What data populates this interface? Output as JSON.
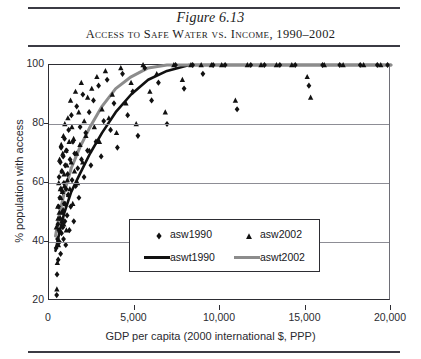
{
  "figure": {
    "number": "Figure 6.13",
    "caption": "Access to Safe Water vs. Income, 1990–2002"
  },
  "chart_data": {
    "type": "scatter",
    "title": "Access to Safe Water vs. Income, 1990–2002",
    "xlabel": "GDP per capita (2000 international $, PPP)",
    "ylabel": "% population with access",
    "xlim": [
      0,
      20000
    ],
    "ylim": [
      20,
      100
    ],
    "xticks": [
      0,
      5000,
      10000,
      15000,
      20000
    ],
    "xticklabels": [
      "0",
      "5,000",
      "10,000",
      "15,000",
      "20,000"
    ],
    "yticks": [
      20,
      40,
      60,
      80,
      100
    ],
    "yticklabels": [
      "20",
      "40",
      "60",
      "80",
      "100"
    ],
    "grid": "horizontal",
    "legend_position": "lower-center",
    "legend": [
      {
        "label": "asw1990",
        "marker": "diamond",
        "color": "#111111"
      },
      {
        "label": "asw2002",
        "marker": "triangle",
        "color": "#111111"
      },
      {
        "label": "aswt1990",
        "marker": "line",
        "color": "#111111"
      },
      {
        "label": "aswt2002",
        "marker": "line",
        "color": "#8c8c8c"
      }
    ],
    "series": [
      {
        "name": "asw1990",
        "marker": "diamond",
        "color": "#111111",
        "points": [
          [
            420,
            38
          ],
          [
            450,
            22
          ],
          [
            470,
            29
          ],
          [
            500,
            41
          ],
          [
            520,
            46
          ],
          [
            540,
            34
          ],
          [
            560,
            52
          ],
          [
            575,
            44
          ],
          [
            590,
            62
          ],
          [
            610,
            40
          ],
          [
            630,
            55
          ],
          [
            650,
            48
          ],
          [
            660,
            67
          ],
          [
            680,
            36
          ],
          [
            700,
            58
          ],
          [
            710,
            72
          ],
          [
            730,
            43
          ],
          [
            750,
            64
          ],
          [
            770,
            50
          ],
          [
            790,
            57
          ],
          [
            810,
            45
          ],
          [
            830,
            69
          ],
          [
            850,
            41
          ],
          [
            870,
            60
          ],
          [
            890,
            53
          ],
          [
            910,
            75
          ],
          [
            930,
            47
          ],
          [
            950,
            66
          ],
          [
            980,
            39
          ],
          [
            1000,
            58
          ],
          [
            1030,
            71
          ],
          [
            1060,
            49
          ],
          [
            1090,
            63
          ],
          [
            1120,
            56
          ],
          [
            1150,
            78
          ],
          [
            1190,
            44
          ],
          [
            1230,
            68
          ],
          [
            1270,
            52
          ],
          [
            1310,
            83
          ],
          [
            1350,
            61
          ],
          [
            1400,
            74
          ],
          [
            1450,
            47
          ],
          [
            1500,
            70
          ],
          [
            1560,
            59
          ],
          [
            1620,
            86
          ],
          [
            1680,
            65
          ],
          [
            1750,
            55
          ],
          [
            1820,
            79
          ],
          [
            1900,
            68
          ],
          [
            1980,
            90
          ],
          [
            2050,
            62
          ],
          [
            2150,
            77
          ],
          [
            2250,
            71
          ],
          [
            2350,
            84
          ],
          [
            2450,
            66
          ],
          [
            2600,
            88
          ],
          [
            2750,
            74
          ],
          [
            2900,
            93
          ],
          [
            3050,
            69
          ],
          [
            3200,
            81
          ],
          [
            3400,
            95
          ],
          [
            3600,
            78
          ],
          [
            3800,
            87
          ],
          [
            4000,
            72
          ],
          [
            4300,
            97
          ],
          [
            4600,
            83
          ],
          [
            4900,
            91
          ],
          [
            5200,
            76
          ],
          [
            5600,
            99
          ],
          [
            6000,
            88
          ],
          [
            6400,
            94
          ],
          [
            6900,
            80
          ],
          [
            7400,
            100
          ],
          [
            7900,
            92
          ],
          [
            8400,
            100
          ],
          [
            9000,
            97
          ],
          [
            9600,
            100
          ],
          [
            10300,
            100
          ],
          [
            11000,
            85
          ],
          [
            11800,
            100
          ],
          [
            12600,
            100
          ],
          [
            13500,
            100
          ],
          [
            14400,
            100
          ],
          [
            15200,
            93
          ],
          [
            16000,
            100
          ],
          [
            17000,
            100
          ],
          [
            18200,
            100
          ],
          [
            19200,
            100
          ],
          [
            19800,
            100
          ]
        ]
      },
      {
        "name": "asw2002",
        "marker": "triangle",
        "color": "#111111",
        "points": [
          [
            430,
            45
          ],
          [
            460,
            24
          ],
          [
            490,
            33
          ],
          [
            510,
            52
          ],
          [
            530,
            48
          ],
          [
            550,
            39
          ],
          [
            570,
            60
          ],
          [
            600,
            50
          ],
          [
            620,
            68
          ],
          [
            640,
            44
          ],
          [
            665,
            58
          ],
          [
            690,
            55
          ],
          [
            715,
            73
          ],
          [
            740,
            47
          ],
          [
            760,
            64
          ],
          [
            785,
            57
          ],
          [
            805,
            70
          ],
          [
            825,
            51
          ],
          [
            845,
            76
          ],
          [
            865,
            46
          ],
          [
            885,
            63
          ],
          [
            905,
            59
          ],
          [
            925,
            80
          ],
          [
            955,
            53
          ],
          [
            985,
            71
          ],
          [
            1015,
            44
          ],
          [
            1045,
            66
          ],
          [
            1075,
            61
          ],
          [
            1105,
            82
          ],
          [
            1140,
            56
          ],
          [
            1180,
            74
          ],
          [
            1220,
            58
          ],
          [
            1260,
            88
          ],
          [
            1300,
            67
          ],
          [
            1340,
            79
          ],
          [
            1390,
            53
          ],
          [
            1440,
            75
          ],
          [
            1490,
            64
          ],
          [
            1550,
            91
          ],
          [
            1610,
            70
          ],
          [
            1670,
            60
          ],
          [
            1740,
            84
          ],
          [
            1810,
            73
          ],
          [
            1890,
            94
          ],
          [
            1970,
            67
          ],
          [
            2060,
            81
          ],
          [
            2160,
            76
          ],
          [
            2260,
            89
          ],
          [
            2370,
            71
          ],
          [
            2500,
            92
          ],
          [
            2650,
            79
          ],
          [
            2800,
            96
          ],
          [
            2950,
            74
          ],
          [
            3100,
            85
          ],
          [
            3300,
            98
          ],
          [
            3500,
            82
          ],
          [
            3700,
            90
          ],
          [
            3950,
            77
          ],
          [
            4200,
            99
          ],
          [
            4500,
            87
          ],
          [
            4800,
            94
          ],
          [
            5100,
            80
          ],
          [
            5500,
            100
          ],
          [
            5900,
            91
          ],
          [
            6300,
            97
          ],
          [
            6800,
            84
          ],
          [
            7300,
            100
          ],
          [
            7800,
            95
          ],
          [
            8300,
            100
          ],
          [
            8900,
            100
          ],
          [
            9500,
            100
          ],
          [
            10100,
            100
          ],
          [
            10900,
            88
          ],
          [
            11600,
            100
          ],
          [
            12400,
            100
          ],
          [
            13300,
            100
          ],
          [
            14200,
            100
          ],
          [
            15100,
            96
          ],
          [
            15300,
            89
          ],
          [
            16100,
            100
          ],
          [
            17200,
            100
          ],
          [
            18400,
            100
          ],
          [
            19400,
            100
          ]
        ]
      }
    ],
    "trendlines": [
      {
        "name": "aswt1990",
        "color": "#111111",
        "width": 2.6,
        "points": [
          [
            380,
            37
          ],
          [
            600,
            43
          ],
          [
            900,
            50
          ],
          [
            1300,
            57
          ],
          [
            1800,
            63
          ],
          [
            2400,
            70
          ],
          [
            3100,
            77
          ],
          [
            3900,
            84
          ],
          [
            4800,
            90
          ],
          [
            5800,
            95
          ],
          [
            6900,
            98
          ],
          [
            8200,
            100
          ],
          [
            9600,
            100
          ],
          [
            20000,
            100
          ]
        ]
      },
      {
        "name": "aswt2002",
        "color": "#8c8c8c",
        "width": 3.0,
        "points": [
          [
            380,
            42
          ],
          [
            600,
            49
          ],
          [
            900,
            57
          ],
          [
            1300,
            65
          ],
          [
            1800,
            72
          ],
          [
            2400,
            79
          ],
          [
            3100,
            86
          ],
          [
            3900,
            92
          ],
          [
            4800,
            96
          ],
          [
            5800,
            99
          ],
          [
            6900,
            100
          ],
          [
            8200,
            100
          ],
          [
            9600,
            100
          ],
          [
            20000,
            100
          ]
        ]
      }
    ]
  }
}
